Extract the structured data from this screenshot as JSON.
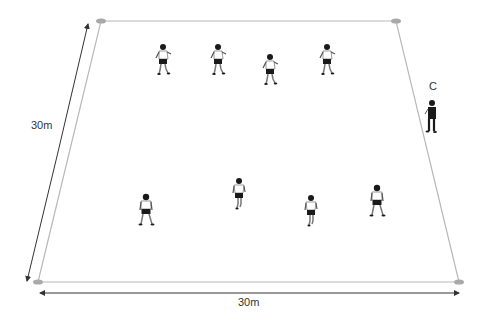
{
  "diagram": {
    "type": "football-drill",
    "pitch": {
      "corners": {
        "top_left": [
          101,
          21
        ],
        "top_right": [
          396,
          21
        ],
        "bottom_right": [
          459,
          282
        ],
        "bottom_left": [
          38,
          282
        ]
      },
      "line_color": "#b8b8b8",
      "cone_color": "#a9a9a9"
    },
    "dimensions": {
      "side_label": "30m",
      "bottom_label": "30m",
      "arrow_color": "#333333"
    },
    "coach": {
      "label": "C",
      "position": [
        432,
        118
      ]
    },
    "players": [
      {
        "id": "p1",
        "row": "top",
        "position": [
          163,
          62
        ],
        "pose": "running",
        "shorts": "#222222"
      },
      {
        "id": "p2",
        "row": "top",
        "position": [
          218,
          62
        ],
        "pose": "running",
        "shorts": "#222222"
      },
      {
        "id": "p3",
        "row": "top",
        "position": [
          270,
          72
        ],
        "pose": "running",
        "shorts": "#222222"
      },
      {
        "id": "p4",
        "row": "top",
        "position": [
          327,
          62
        ],
        "pose": "running",
        "shorts": "#222222"
      },
      {
        "id": "p5",
        "row": "bottom",
        "position": [
          146,
          212
        ],
        "pose": "standing",
        "shorts": "#222222"
      },
      {
        "id": "p6",
        "row": "bottom",
        "position": [
          239,
          196
        ],
        "pose": "walking",
        "shorts": "#222222"
      },
      {
        "id": "p7",
        "row": "bottom",
        "position": [
          311,
          213
        ],
        "pose": "walking",
        "shorts": "#222222"
      },
      {
        "id": "p8",
        "row": "bottom",
        "position": [
          377,
          203
        ],
        "pose": "standing",
        "shorts": "#222222"
      }
    ]
  }
}
